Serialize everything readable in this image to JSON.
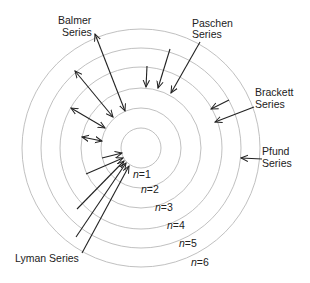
{
  "diagram": {
    "center": [
      141,
      148
    ],
    "orbits": [
      {
        "n": 1,
        "r": 20,
        "label": "n=1",
        "label_x": 133,
        "label_y": 178
      },
      {
        "n": 2,
        "r": 40,
        "label": "n=2",
        "label_x": 141,
        "label_y": 193
      },
      {
        "n": 3,
        "r": 60,
        "label": "n=3",
        "label_x": 155,
        "label_y": 211
      },
      {
        "n": 4,
        "r": 81,
        "label": "n=4",
        "label_x": 167,
        "label_y": 229
      },
      {
        "n": 5,
        "r": 100,
        "label": "n=5",
        "label_x": 179,
        "label_y": 247
      },
      {
        "n": 6,
        "r": 119,
        "label": "n=6",
        "label_x": 191,
        "label_y": 266
      }
    ],
    "series": [
      {
        "name": "Balmer",
        "label_lines": [
          "Balmer",
          "Series"
        ],
        "label_pos": [
          [
            58,
            24
          ],
          [
            62,
            36
          ]
        ],
        "double_headed": true,
        "arrows": [
          [
            95,
            34,
            125,
            111
          ],
          [
            75,
            71,
            113,
            117
          ],
          [
            71,
            108,
            105,
            128
          ],
          [
            82,
            137,
            102,
            141
          ]
        ]
      },
      {
        "name": "Paschen",
        "label_lines": [
          "Paschen",
          "Series"
        ],
        "label_pos": [
          [
            192,
            27
          ],
          [
            192,
            38
          ]
        ],
        "double_headed": false,
        "arrows": [
          [
            147,
            66,
            146,
            87
          ],
          [
            170,
            49,
            158,
            88
          ],
          [
            200,
            42,
            171,
            93
          ]
        ]
      },
      {
        "name": "Brackett",
        "label_lines": [
          "Brackett",
          "Series"
        ],
        "label_pos": [
          [
            255,
            96
          ],
          [
            255,
            108
          ]
        ],
        "double_headed": false,
        "arrows": [
          [
            229,
            100,
            211,
            109
          ],
          [
            254,
            107,
            215,
            122
          ]
        ]
      },
      {
        "name": "Pfund",
        "label_lines": [
          "Pfund",
          "Series"
        ],
        "label_pos": [
          [
            262,
            155
          ],
          [
            262,
            167
          ]
        ],
        "double_headed": false,
        "arrows": [
          [
            262,
            159,
            241,
            158
          ]
        ]
      },
      {
        "name": "Lyman",
        "label_lines": [
          "Lyman Series"
        ],
        "label_pos": [
          [
            15,
            262
          ]
        ],
        "double_headed": false,
        "arrows": [
          [
            102,
            158,
            122,
            153
          ],
          [
            86,
            174,
            123,
            158
          ],
          [
            77,
            209,
            124,
            161
          ],
          [
            76,
            237,
            126,
            163
          ],
          [
            82,
            253,
            129,
            166
          ]
        ]
      }
    ],
    "colors": {
      "orbit": "#b9b9b9",
      "arrow": "#222222",
      "text": "#222222"
    }
  }
}
